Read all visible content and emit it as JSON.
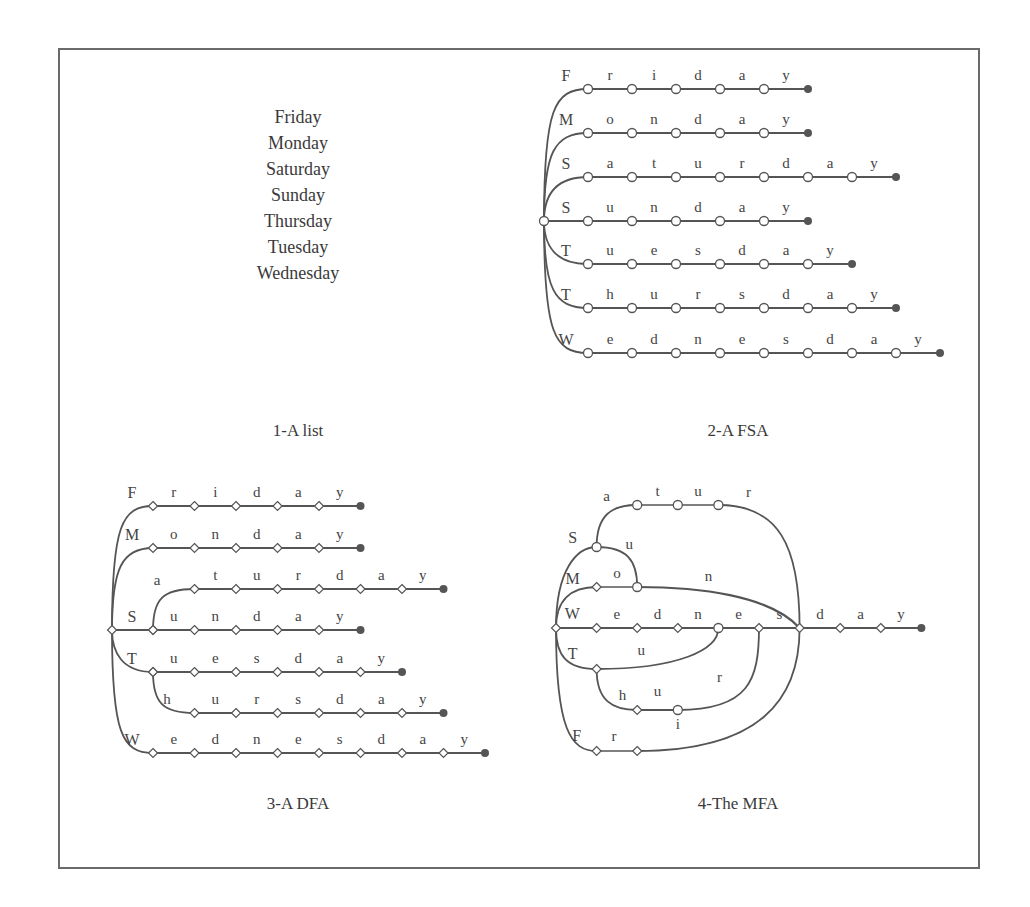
{
  "panels": [
    {
      "id": "list",
      "caption": "1-A list",
      "words": [
        "Friday",
        "Monday",
        "Saturday",
        "Sunday",
        "Thursday",
        "Tuesday",
        "Wednesday"
      ]
    },
    {
      "id": "fsa",
      "caption": "2-A FSA",
      "rows": [
        {
          "first": "F",
          "rest": [
            "r",
            "i",
            "d",
            "a",
            "y"
          ]
        },
        {
          "first": "M",
          "rest": [
            "o",
            "n",
            "d",
            "a",
            "y"
          ]
        },
        {
          "first": "S",
          "rest": [
            "a",
            "t",
            "u",
            "r",
            "d",
            "a",
            "y"
          ]
        },
        {
          "first": "S",
          "rest": [
            "u",
            "n",
            "d",
            "a",
            "y"
          ]
        },
        {
          "first": "T",
          "rest": [
            "u",
            "e",
            "s",
            "d",
            "a",
            "y"
          ]
        },
        {
          "first": "T",
          "rest": [
            "h",
            "u",
            "r",
            "s",
            "d",
            "a",
            "y"
          ]
        },
        {
          "first": "W",
          "rest": [
            "e",
            "d",
            "n",
            "e",
            "s",
            "d",
            "a",
            "y"
          ]
        }
      ]
    },
    {
      "id": "dfa",
      "caption": "3-A DFA",
      "rows": [
        {
          "prefix": "F",
          "rest": [
            "r",
            "i",
            "d",
            "a",
            "y"
          ]
        },
        {
          "prefix": "M",
          "rest": [
            "o",
            "n",
            "d",
            "a",
            "y"
          ]
        },
        {
          "prefix": "S",
          "branch": "a",
          "rest": [
            "t",
            "u",
            "r",
            "d",
            "a",
            "y"
          ]
        },
        {
          "prefix": "S",
          "rest": [
            "u",
            "n",
            "d",
            "a",
            "y"
          ]
        },
        {
          "prefix": "T",
          "rest": [
            "u",
            "e",
            "s",
            "d",
            "a",
            "y"
          ]
        },
        {
          "prefix": "T",
          "branch": "h",
          "rest": [
            "u",
            "r",
            "s",
            "d",
            "a",
            "y"
          ]
        },
        {
          "prefix": "W",
          "rest": [
            "e",
            "d",
            "n",
            "e",
            "s",
            "d",
            "a",
            "y"
          ]
        }
      ]
    },
    {
      "id": "mfa",
      "caption": "4-The MFA",
      "main_path": [
        "W",
        "e",
        "d",
        "n",
        "e",
        "s",
        "d",
        "a",
        "y"
      ],
      "branches": [
        {
          "label": "S",
          "then": [
            "a",
            "t",
            "u",
            "r"
          ]
        },
        {
          "label": "S",
          "then": [
            "u"
          ]
        },
        {
          "label": "M",
          "then": [
            "o",
            "n"
          ]
        },
        {
          "label": "T",
          "then": [
            "u"
          ]
        },
        {
          "label": "T",
          "then": [
            "h",
            "u",
            "r"
          ]
        },
        {
          "label": "F",
          "then": [
            "r",
            "i"
          ]
        }
      ]
    }
  ],
  "colors": {
    "line": "#555555",
    "node_fill": "#ffffff",
    "final_node": "#555555",
    "border": "#6a6a6a",
    "text": "#3a3a3a"
  }
}
